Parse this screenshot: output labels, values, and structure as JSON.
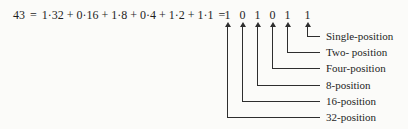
{
  "equation": {
    "decimal": "43",
    "equals": "=",
    "expansion": "1·32 + 0·16 + 1·8 + 0·4 + 1·2 + 1·1"
  },
  "binary": {
    "digits": [
      {
        "bit": "1",
        "position_label": "32-position"
      },
      {
        "bit": "0",
        "position_label": "16-position"
      },
      {
        "bit": "1",
        "position_label": "8-position"
      },
      {
        "bit": "0",
        "position_label": "Four-position"
      },
      {
        "bit": "1",
        "position_label": "Two- position"
      },
      {
        "bit": "1",
        "position_label": "Single-position"
      }
    ]
  },
  "colors": {
    "ink": "#1e1e1e",
    "line": "#2e2e2e",
    "background": "#fbfbf9"
  }
}
